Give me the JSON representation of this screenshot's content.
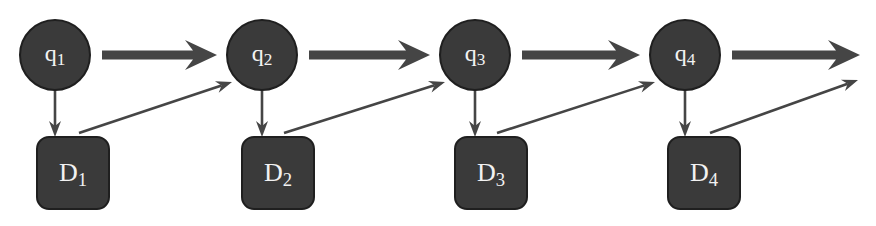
{
  "diagram": {
    "title": "",
    "colors": {
      "node_fill": "#3a3a3a",
      "node_stroke": "#1f1f1f",
      "arrow": "#454545",
      "text": "#f2f2f2",
      "background": "#ffffff"
    },
    "states": [
      {
        "id": "q1",
        "base": "q",
        "sub": "1"
      },
      {
        "id": "q2",
        "base": "q",
        "sub": "2"
      },
      {
        "id": "q3",
        "base": "q",
        "sub": "3"
      },
      {
        "id": "q4",
        "base": "q",
        "sub": "4"
      }
    ],
    "documents": [
      {
        "id": "D1",
        "base": "D",
        "sub": "1"
      },
      {
        "id": "D2",
        "base": "D",
        "sub": "2"
      },
      {
        "id": "D3",
        "base": "D",
        "sub": "3"
      },
      {
        "id": "D4",
        "base": "D",
        "sub": "4"
      }
    ],
    "edges": [
      {
        "from": "q1",
        "to": "q2",
        "kind": "thick"
      },
      {
        "from": "q2",
        "to": "q3",
        "kind": "thick"
      },
      {
        "from": "q3",
        "to": "q4",
        "kind": "thick"
      },
      {
        "from": "q4",
        "to": null,
        "kind": "thick"
      },
      {
        "from": "q1",
        "to": "D1",
        "kind": "thin"
      },
      {
        "from": "q2",
        "to": "D2",
        "kind": "thin"
      },
      {
        "from": "q3",
        "to": "D3",
        "kind": "thin"
      },
      {
        "from": "q4",
        "to": "D4",
        "kind": "thin"
      },
      {
        "from": "D1",
        "to": "q2",
        "kind": "thin"
      },
      {
        "from": "D2",
        "to": "q3",
        "kind": "thin"
      },
      {
        "from": "D3",
        "to": "q4",
        "kind": "thin"
      },
      {
        "from": "D4",
        "to": null,
        "kind": "thin"
      }
    ]
  }
}
